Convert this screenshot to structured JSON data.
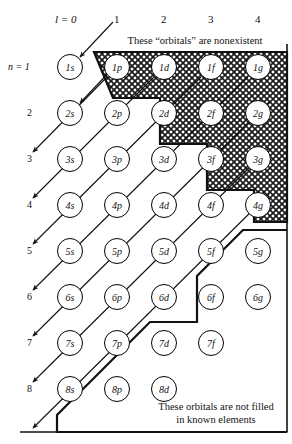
{
  "figure": {
    "title_note_top": "These “orbitals” are nonexistent",
    "note_bottom_line1": "These orbitals are not filled",
    "note_bottom_line2": "in known elements",
    "column_axis_label": "l = 0",
    "row_axis_label": "n = 1",
    "colors": {
      "line": "#000000",
      "background": "#ffffff",
      "hatch": "#222222"
    }
  },
  "columns": [
    {
      "label": "l = 0",
      "l": 0,
      "sublabel": "s",
      "x": 70
    },
    {
      "label": "1",
      "l": 1,
      "sublabel": "p",
      "x": 117
    },
    {
      "label": "2",
      "l": 2,
      "sublabel": "d",
      "x": 164
    },
    {
      "label": "3",
      "l": 3,
      "sublabel": "f",
      "x": 211
    },
    {
      "label": "4",
      "l": 4,
      "sublabel": "g",
      "x": 258
    }
  ],
  "rows": [
    {
      "label": "n = 1",
      "n": 1,
      "y": 67
    },
    {
      "label": "2",
      "n": 2,
      "y": 113
    },
    {
      "label": "3",
      "n": 3,
      "y": 159
    },
    {
      "label": "4",
      "n": 4,
      "y": 205
    },
    {
      "label": "5",
      "n": 5,
      "y": 251
    },
    {
      "label": "6",
      "n": 6,
      "y": 297
    },
    {
      "label": "7",
      "n": 7,
      "y": 343
    },
    {
      "label": "8",
      "n": 8,
      "y": 389
    }
  ],
  "orbitals": [
    {
      "label": "1s",
      "n": 1,
      "l": 0,
      "col": 0,
      "row": 0,
      "region": "normal"
    },
    {
      "label": "1p",
      "n": 1,
      "l": 1,
      "col": 1,
      "row": 0,
      "region": "nonexistent"
    },
    {
      "label": "1d",
      "n": 1,
      "l": 2,
      "col": 2,
      "row": 0,
      "region": "nonexistent"
    },
    {
      "label": "1f",
      "n": 1,
      "l": 3,
      "col": 3,
      "row": 0,
      "region": "nonexistent"
    },
    {
      "label": "1g",
      "n": 1,
      "l": 4,
      "col": 4,
      "row": 0,
      "region": "nonexistent"
    },
    {
      "label": "2s",
      "n": 2,
      "l": 0,
      "col": 0,
      "row": 1,
      "region": "normal"
    },
    {
      "label": "2p",
      "n": 2,
      "l": 1,
      "col": 1,
      "row": 1,
      "region": "normal"
    },
    {
      "label": "2d",
      "n": 2,
      "l": 2,
      "col": 2,
      "row": 1,
      "region": "nonexistent"
    },
    {
      "label": "2f",
      "n": 2,
      "l": 3,
      "col": 3,
      "row": 1,
      "region": "nonexistent"
    },
    {
      "label": "2g",
      "n": 2,
      "l": 4,
      "col": 4,
      "row": 1,
      "region": "nonexistent"
    },
    {
      "label": "3s",
      "n": 3,
      "l": 0,
      "col": 0,
      "row": 2,
      "region": "normal"
    },
    {
      "label": "3p",
      "n": 3,
      "l": 1,
      "col": 1,
      "row": 2,
      "region": "normal"
    },
    {
      "label": "3d",
      "n": 3,
      "l": 2,
      "col": 2,
      "row": 2,
      "region": "normal"
    },
    {
      "label": "3f",
      "n": 3,
      "l": 3,
      "col": 3,
      "row": 2,
      "region": "nonexistent"
    },
    {
      "label": "3g",
      "n": 3,
      "l": 4,
      "col": 4,
      "row": 2,
      "region": "nonexistent"
    },
    {
      "label": "4s",
      "n": 4,
      "l": 0,
      "col": 0,
      "row": 3,
      "region": "normal"
    },
    {
      "label": "4p",
      "n": 4,
      "l": 1,
      "col": 1,
      "row": 3,
      "region": "normal"
    },
    {
      "label": "4d",
      "n": 4,
      "l": 2,
      "col": 2,
      "row": 3,
      "region": "normal"
    },
    {
      "label": "4f",
      "n": 4,
      "l": 3,
      "col": 3,
      "row": 3,
      "region": "normal"
    },
    {
      "label": "4g",
      "n": 4,
      "l": 4,
      "col": 4,
      "row": 3,
      "region": "nonexistent"
    },
    {
      "label": "5s",
      "n": 5,
      "l": 0,
      "col": 0,
      "row": 4,
      "region": "normal"
    },
    {
      "label": "5p",
      "n": 5,
      "l": 1,
      "col": 1,
      "row": 4,
      "region": "normal"
    },
    {
      "label": "5d",
      "n": 5,
      "l": 2,
      "col": 2,
      "row": 4,
      "region": "normal"
    },
    {
      "label": "5f",
      "n": 5,
      "l": 3,
      "col": 3,
      "row": 4,
      "region": "normal"
    },
    {
      "label": "5g",
      "n": 5,
      "l": 4,
      "col": 4,
      "row": 4,
      "region": "unfilled"
    },
    {
      "label": "6s",
      "n": 6,
      "l": 0,
      "col": 0,
      "row": 5,
      "region": "normal"
    },
    {
      "label": "6p",
      "n": 6,
      "l": 1,
      "col": 1,
      "row": 5,
      "region": "normal"
    },
    {
      "label": "6d",
      "n": 6,
      "l": 2,
      "col": 2,
      "row": 5,
      "region": "normal"
    },
    {
      "label": "6f",
      "n": 6,
      "l": 3,
      "col": 3,
      "row": 5,
      "region": "unfilled"
    },
    {
      "label": "6g",
      "n": 6,
      "l": 4,
      "col": 4,
      "row": 5,
      "region": "unfilled"
    },
    {
      "label": "7s",
      "n": 7,
      "l": 0,
      "col": 0,
      "row": 6,
      "region": "normal"
    },
    {
      "label": "7p",
      "n": 7,
      "l": 1,
      "col": 1,
      "row": 6,
      "region": "normal"
    },
    {
      "label": "7d",
      "n": 7,
      "l": 2,
      "col": 2,
      "row": 6,
      "region": "unfilled"
    },
    {
      "label": "7f",
      "n": 7,
      "l": 3,
      "col": 3,
      "row": 6,
      "region": "unfilled"
    },
    {
      "label": "8s",
      "n": 8,
      "l": 0,
      "col": 0,
      "row": 7,
      "region": "normal"
    },
    {
      "label": "8p",
      "n": 8,
      "l": 1,
      "col": 1,
      "row": 7,
      "region": "unfilled"
    },
    {
      "label": "8d",
      "n": 8,
      "l": 2,
      "col": 2,
      "row": 7,
      "region": "unfilled"
    }
  ],
  "diagonal_arrows": [
    {
      "name": "arrow-1s",
      "from_col": 1,
      "from_row": -1,
      "to_col": 0,
      "to_row": 0
    },
    {
      "name": "arrow-2s",
      "from_col": 1,
      "from_row": 0,
      "to_col": 0,
      "to_row": 1
    },
    {
      "name": "arrow-2p-3s",
      "from_col": 2,
      "from_row": 0,
      "to_col": 0,
      "to_row": 2
    },
    {
      "name": "arrow-3p-4s",
      "from_col": 3,
      "from_row": 0,
      "to_col": 0,
      "to_row": 3
    },
    {
      "name": "arrow-3d-4p-5s",
      "from_col": 4,
      "from_row": 0,
      "to_col": 0,
      "to_row": 4
    },
    {
      "name": "arrow-4d-5p-6s",
      "from_col": 4,
      "from_row": 1,
      "to_col": 0,
      "to_row": 5
    },
    {
      "name": "arrow-5d-6p-7s",
      "from_col": 4,
      "from_row": 2,
      "to_col": 0,
      "to_row": 6
    },
    {
      "name": "arrow-6d-7p-8s",
      "from_col": 4,
      "from_row": 3,
      "to_col": 0,
      "to_row": 7
    },
    {
      "name": "arrow-7d-8p",
      "from_col": 4,
      "from_row": 4,
      "to_col": 0,
      "to_row": 8
    }
  ]
}
